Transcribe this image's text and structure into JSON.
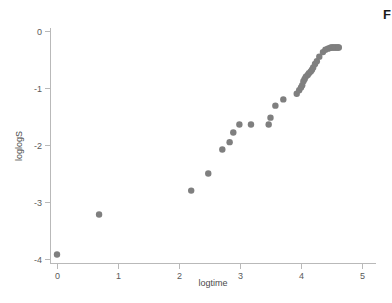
{
  "figure": {
    "background_color": "#ffffff",
    "width": 392,
    "height": 303,
    "edge_fragment_text": "F"
  },
  "chart_data": {
    "type": "scatter",
    "title": "",
    "subtitle": "",
    "xlabel": "logtime",
    "ylabel": "loglogS",
    "xlim": [
      -0.25,
      5.3
    ],
    "ylim": [
      -4.18,
      0.12
    ],
    "xticks": [
      0,
      1,
      2,
      3,
      4,
      5
    ],
    "xticklabels": [
      "0",
      "1",
      "2",
      "3",
      "4",
      "5"
    ],
    "yticks": [
      0,
      -1,
      -2,
      -3,
      -4
    ],
    "yticklabels": [
      "0",
      "-1",
      "-2",
      "-3",
      "-4"
    ],
    "grid": false,
    "legend": null,
    "legend_position": "none",
    "marker": {
      "shape": "circle",
      "color": "#7f7f7f",
      "size_px": 4.2
    },
    "axis_color": "#b9b9b9",
    "series": [
      {
        "name": "loglogS",
        "x": [
          0.0,
          0.69,
          2.2,
          2.48,
          2.71,
          2.83,
          2.89,
          2.99,
          3.18,
          3.47,
          3.5,
          3.58,
          3.71,
          3.93,
          3.97,
          4.0,
          4.02,
          4.04,
          4.06,
          4.08,
          4.11,
          4.13,
          4.16,
          4.18,
          4.2,
          4.23,
          4.26,
          4.3,
          4.36,
          4.4,
          4.44,
          4.47,
          4.49,
          4.51,
          4.53,
          4.55,
          4.57,
          4.59,
          4.61,
          4.62
        ],
        "y": [
          -3.92,
          -3.22,
          -2.8,
          -2.5,
          -2.08,
          -1.95,
          -1.78,
          -1.64,
          -1.64,
          -1.64,
          -1.52,
          -1.31,
          -1.2,
          -1.1,
          -1.04,
          -0.99,
          -0.95,
          -0.88,
          -0.84,
          -0.8,
          -0.77,
          -0.74,
          -0.71,
          -0.68,
          -0.64,
          -0.58,
          -0.53,
          -0.45,
          -0.37,
          -0.33,
          -0.31,
          -0.3,
          -0.29,
          -0.29,
          -0.29,
          -0.29,
          -0.29,
          -0.29,
          -0.29,
          -0.29
        ]
      }
    ]
  }
}
